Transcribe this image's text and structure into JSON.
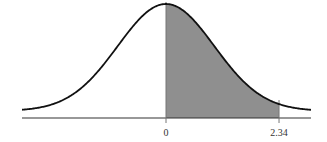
{
  "chart_data": {
    "type": "area",
    "title": "",
    "subtitle": "",
    "xlabel": "",
    "ylabel": "",
    "distribution": {
      "name": "standard normal",
      "mean": 0,
      "sd": 1
    },
    "shaded_region": {
      "from": 0,
      "to": 2.34
    },
    "xlim": [
      -2.98,
      3.0
    ],
    "tick_labels": [
      "0",
      "2.34"
    ],
    "tick_values": [
      0,
      2.34
    ],
    "grid": false,
    "legend": null
  },
  "colors": {
    "curve": "#111111",
    "shade": "#8f8f8f",
    "axis": "#333333",
    "background": "#ffffff"
  },
  "labels": {
    "tick_zero": "0",
    "tick_end": "2.34"
  }
}
